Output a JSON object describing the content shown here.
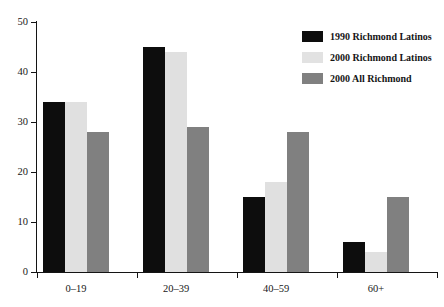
{
  "chart_data": {
    "type": "bar",
    "title": "",
    "subtitle": "",
    "xlabel": "",
    "ylabel": "",
    "categories": [
      "0–19",
      "20–39",
      "40–59",
      "60+"
    ],
    "series": [
      {
        "name": "1990 Richmond Latinos",
        "color": "#0d0d0d",
        "values": [
          34,
          45,
          15,
          6
        ]
      },
      {
        "name": "2000 Richmond Latinos",
        "color": "#e0e0e0",
        "values": [
          34,
          44,
          18,
          4
        ]
      },
      {
        "name": "2000 All Richmond",
        "color": "#808080",
        "values": [
          28,
          29,
          28,
          15
        ]
      }
    ],
    "ylim": [
      0,
      50
    ],
    "ytick_values": [
      0,
      10,
      20,
      30,
      40,
      50
    ],
    "ytick_labels": [
      "0",
      "10",
      "20",
      "30",
      "40",
      "50"
    ],
    "grid": false,
    "legend_position": "top-right",
    "annotations": []
  },
  "legend": {
    "entries": [
      {
        "label": "1990 Richmond Latinos",
        "swatch": "#0d0d0d"
      },
      {
        "label": "2000 Richmond Latinos",
        "swatch": "#e2e2e2"
      },
      {
        "label": "2000 All Richmond",
        "swatch": "#808080"
      }
    ]
  },
  "axes": {
    "y_ticks": [
      "0",
      "10",
      "20",
      "30",
      "40",
      "50"
    ],
    "x_categories": [
      "0–19",
      "20–39",
      "40–59",
      "60+"
    ]
  }
}
